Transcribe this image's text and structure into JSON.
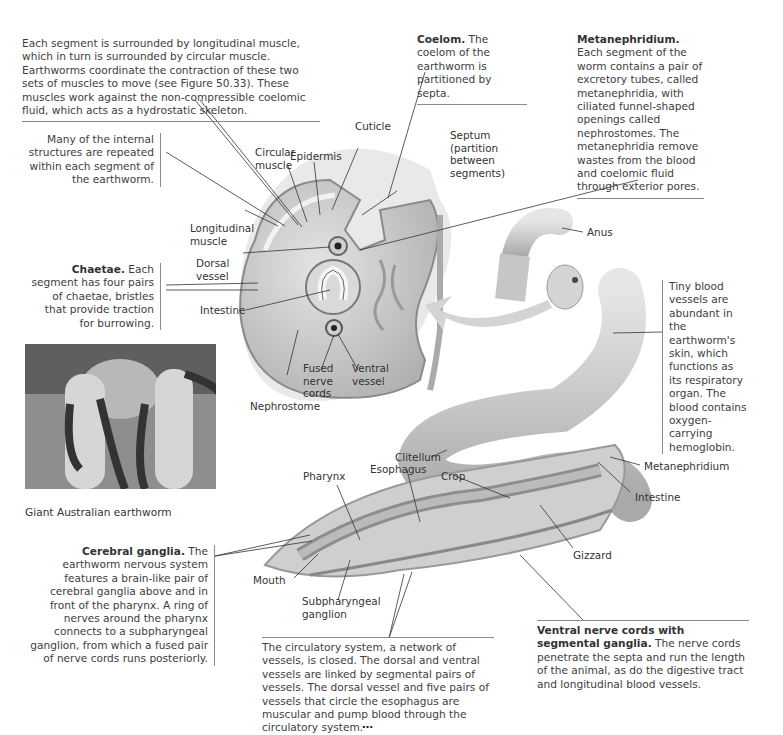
{
  "figure": {
    "colors": {
      "background": "#ffffff",
      "text": "#3d3d3d",
      "leader_line": "#333333",
      "worm_body": "#c8c8c8",
      "arrow": "#cfcfcf"
    }
  },
  "callouts": {
    "muscles": {
      "text": "Each segment is surrounded by longitudinal muscle, which in turn is surrounded by circular muscle. Earthworms coordinate the contraction of these two sets of muscles to move (see Figure 50.33). These muscles work against the non-compressible coelomic fluid, which acts as a hydrostatic skeleton."
    },
    "coelom": {
      "bold": "Coelom.",
      "text": " The coelom of the earthworm is partitioned by septa."
    },
    "metanephridium": {
      "bold": "Metanephridium.",
      "text": " Each segment of the worm contains a pair of excretory tubes, called metanephridia, with ciliated funnel-shaped openings called nephrostomes. The metanephridia remove wastes from the blood and coelomic fluid through exterior pores."
    },
    "repeated": {
      "text": "Many of the internal structures are repeated within each segment of the earthworm."
    },
    "chaetae": {
      "bold": "Chaetae.",
      "text": " Each segment has four pairs of chaetae, bristles that provide traction for burrowing."
    },
    "skin": {
      "text": "Tiny blood vessels are abundant in the earthworm's skin, which functions as its respiratory organ. The blood contains oxygen-carrying hemoglobin."
    },
    "cerebral": {
      "bold": "Cerebral ganglia.",
      "text": " The earthworm nervous system features a brain-like pair of cerebral ganglia above and in front of the pharynx. A ring of nerves around the pharynx connects to a subpharyngeal ganglion, from which a fused pair of nerve cords runs posteriorly."
    },
    "circulatory": {
      "text": "The circulatory system, a network of vessels, is closed. The dorsal and ventral vessels are linked by segmental pairs of vessels. The dorsal vessel and five pairs of vessels that circle the esophagus are muscular and pump blood through the circulatory system."
    },
    "ventral": {
      "bold": "Ventral nerve cords with segmental ganglia.",
      "text": " The nerve cords penetrate the septa and run the length of the animal, as do the digestive tract and longitudinal blood vessels."
    }
  },
  "labels": {
    "epidermis": "Epidermis",
    "cuticle": "Cuticle",
    "circular_muscle": "Circular muscle",
    "septum": "Septum (partition between segments)",
    "longitudinal_muscle": "Longitudinal muscle",
    "dorsal_vessel": "Dorsal vessel",
    "intestine_cs": "Intestine",
    "fused_nerve_cords": "Fused nerve cords",
    "ventral_vessel": "Ventral vessel",
    "nephrostome": "Nephrostome",
    "anus": "Anus",
    "clitellum": "Clitellum",
    "pharynx": "Pharynx",
    "esophagus": "Esophagus",
    "crop": "Crop",
    "metanephridium": "Metanephridium",
    "intestine_long": "Intestine",
    "gizzard": "Gizzard",
    "mouth": "Mouth",
    "subpharyngeal": "Subpharyngeal ganglion"
  },
  "photo": {
    "caption": "Giant Australian earthworm"
  },
  "footer": {
    "fragment": "…"
  }
}
